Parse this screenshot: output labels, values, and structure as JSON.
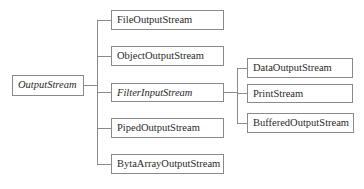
{
  "diagram": {
    "title": "",
    "root": {
      "label": "OutputStream",
      "italic": true
    },
    "children": [
      {
        "label": "FileOutputStream",
        "italic": false
      },
      {
        "label": "ObjectOutputStream",
        "italic": false
      },
      {
        "label": "FilterInputStream",
        "italic": true
      },
      {
        "label": "PipedOutputStream",
        "italic": false
      },
      {
        "label": "BytaArrayOutputStream",
        "italic": false
      }
    ],
    "filter_children": [
      {
        "label": "DataOutputStream",
        "italic": false
      },
      {
        "label": "PrintStream",
        "italic": false
      },
      {
        "label": "BufferedOutputStream",
        "italic": false
      }
    ],
    "colors": {
      "line": "#8a8a8a",
      "text": "#2a2a2a",
      "background": "#ffffff"
    }
  }
}
